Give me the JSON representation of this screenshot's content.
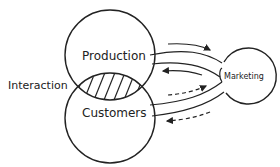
{
  "diagram": {
    "nodes": [
      {
        "id": "production",
        "label": "Production"
      },
      {
        "id": "customers",
        "label": "Customers"
      },
      {
        "id": "marketing",
        "label": "Marketing"
      }
    ],
    "overlap_label": "Interaction",
    "arrows": [
      {
        "from": "production",
        "to": "marketing",
        "style": "solid"
      },
      {
        "from": "marketing",
        "to": "production",
        "style": "solid"
      },
      {
        "from": "customers",
        "to": "marketing",
        "style": "dashed"
      },
      {
        "from": "marketing",
        "to": "customers",
        "style": "dashed"
      }
    ],
    "colors": {
      "stroke": "#222222",
      "background": "#ffffff"
    }
  }
}
